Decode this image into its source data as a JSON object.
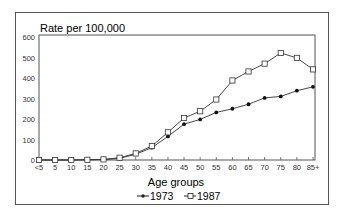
{
  "chart_data": {
    "type": "line",
    "title": "",
    "ylabel": "Rate per 100,000",
    "xlabel": "Age groups",
    "ylim": [
      0,
      600
    ],
    "yticks": [
      0,
      100,
      200,
      300,
      400,
      500,
      600
    ],
    "categories": [
      "<5",
      "5",
      "10",
      "15",
      "20",
      "25",
      "30",
      "35",
      "40",
      "45",
      "50",
      "55",
      "60",
      "65",
      "70",
      "75",
      "80",
      "85+"
    ],
    "series": [
      {
        "name": "1973",
        "marker": "filled-circle",
        "values": [
          0,
          0,
          0,
          1,
          2,
          8,
          28,
          60,
          115,
          175,
          198,
          232,
          250,
          272,
          303,
          310,
          338,
          357
        ]
      },
      {
        "name": "1987",
        "marker": "open-square",
        "values": [
          0,
          0,
          0,
          1,
          3,
          11,
          32,
          68,
          135,
          205,
          238,
          295,
          388,
          432,
          470,
          522,
          498,
          442
        ]
      }
    ],
    "grid": false,
    "legend_position": "bottom"
  },
  "labels": {
    "ylabel": "Rate per 100,000",
    "xlabel": "Age groups",
    "legend_1973": "1973",
    "legend_1987": "1987"
  }
}
